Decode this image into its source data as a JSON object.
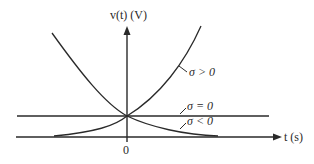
{
  "diagram": {
    "y_axis_label": "v(t) (V)",
    "x_axis_label": "t (s)",
    "origin_label": "0",
    "curves": [
      {
        "name": "growing",
        "label": "σ > 0"
      },
      {
        "name": "constant",
        "label": "σ = 0"
      },
      {
        "name": "decaying",
        "label": "σ < 0"
      }
    ],
    "colors": {
      "line": "#2a2a2a",
      "background": "#ffffff"
    }
  }
}
